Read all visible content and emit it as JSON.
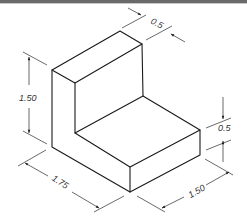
{
  "figure": {
    "type": "isometric-drawing",
    "dimensions": {
      "top_thickness": "0.5",
      "height": "1.50",
      "step_height": "0.5",
      "length": "1.75",
      "depth": "1.50"
    }
  },
  "colors": {
    "line": "#1a1a1a",
    "background": "#ffffff",
    "top_bar": "#6a6a6a"
  }
}
